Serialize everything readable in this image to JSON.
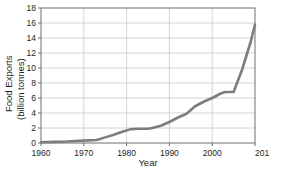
{
  "chart_data": {
    "type": "line",
    "title": "",
    "xlabel": "Year",
    "ylabel": "Food Exports (billion tonnes)",
    "ylabel_line1": "Food Exports",
    "ylabel_line2": "(billion tonnes)",
    "xlim": [
      1960,
      2010
    ],
    "ylim": [
      0,
      18
    ],
    "xticks": [
      1960,
      1970,
      1980,
      1990,
      2000,
      2010
    ],
    "xtick_labels": [
      "1960",
      "1970",
      "1980",
      "1990",
      "2000",
      "201"
    ],
    "yticks": [
      0,
      2,
      4,
      6,
      8,
      10,
      12,
      14,
      16,
      18
    ],
    "ytick_labels": [
      "0",
      "2",
      "4",
      "6",
      "8",
      "10",
      "12",
      "14",
      "16",
      "18"
    ],
    "grid": "horizontal-and-vertical",
    "legend": "none",
    "line_color": "#7d7d7d",
    "grid_color": "#c9c9c9",
    "axis_color": "#6e6e6e",
    "series": [
      {
        "name": "Food Exports",
        "x": [
          1960,
          1963,
          1966,
          1969,
          1971,
          1973,
          1975,
          1977,
          1979,
          1981,
          1983,
          1985,
          1986,
          1988,
          1990,
          1992,
          1994,
          1996,
          1998,
          2000,
          2002,
          2003,
          2005,
          2007,
          2009,
          2010
        ],
        "values": [
          0.1,
          0.15,
          0.2,
          0.3,
          0.35,
          0.4,
          0.75,
          1.1,
          1.5,
          1.85,
          1.9,
          1.9,
          2.0,
          2.3,
          2.8,
          3.4,
          3.9,
          4.9,
          5.5,
          6.0,
          6.6,
          6.8,
          6.8,
          9.8,
          13.5,
          15.8
        ]
      }
    ]
  }
}
